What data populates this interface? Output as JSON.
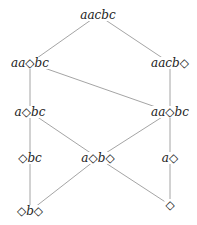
{
  "diagram": {
    "type": "lattice",
    "nodes": [
      {
        "id": "n0",
        "label": "aacbc",
        "x": 98,
        "y": 15
      },
      {
        "id": "n1",
        "label": "aa◇bc",
        "x": 30,
        "y": 63
      },
      {
        "id": "n2",
        "label": "aacb◇",
        "x": 170,
        "y": 63
      },
      {
        "id": "n3",
        "label": "a◇bc",
        "x": 30,
        "y": 112
      },
      {
        "id": "n4",
        "label": "aa◇bc",
        "x": 170,
        "y": 112
      },
      {
        "id": "n5",
        "label": "◇bc",
        "x": 30,
        "y": 158
      },
      {
        "id": "n6",
        "label": "a◇b◇",
        "x": 98,
        "y": 158
      },
      {
        "id": "n7",
        "label": "a◇",
        "x": 170,
        "y": 158
      },
      {
        "id": "n8",
        "label": "◇b◇",
        "x": 30,
        "y": 211
      },
      {
        "id": "n9",
        "label": "◇",
        "x": 170,
        "y": 205
      }
    ],
    "edges": [
      [
        "n0",
        "n1"
      ],
      [
        "n0",
        "n2"
      ],
      [
        "n1",
        "n3"
      ],
      [
        "n1",
        "n4"
      ],
      [
        "n2",
        "n4"
      ],
      [
        "n3",
        "n5"
      ],
      [
        "n3",
        "n6"
      ],
      [
        "n4",
        "n6"
      ],
      [
        "n4",
        "n7"
      ],
      [
        "n5",
        "n8"
      ],
      [
        "n6",
        "n8"
      ],
      [
        "n6",
        "n9"
      ],
      [
        "n7",
        "n9"
      ]
    ],
    "colors": {
      "line": "#9a9a9a",
      "text": "#222222"
    }
  }
}
